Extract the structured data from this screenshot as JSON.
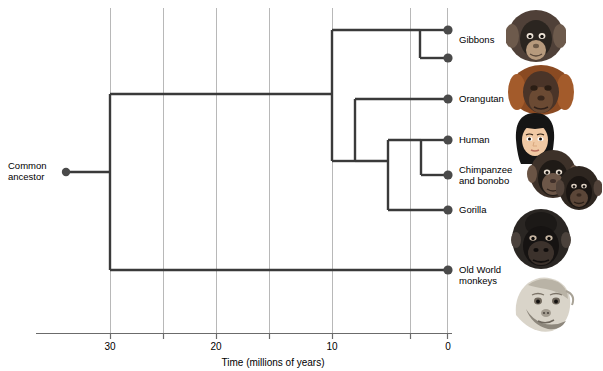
{
  "diagram": {
    "type": "phylogenetic-tree",
    "root_label": "Common\nancestor",
    "axis": {
      "title": "Time (millions of years)",
      "ticks": [
        30,
        25,
        20,
        15,
        10,
        5,
        0
      ],
      "tick_labels_shown": [
        "30",
        "20",
        "10",
        "0"
      ],
      "gridlines_at": [
        30,
        25,
        20,
        15,
        10,
        5,
        0
      ],
      "direction": "right-to-left",
      "units": "millions of years"
    },
    "taxa": [
      {
        "name": "Gibbons",
        "divergence_mya": 3,
        "tip_mya": 0
      },
      {
        "name": "Orangutan",
        "divergence_mya": 11,
        "tip_mya": 0
      },
      {
        "name": "Human",
        "divergence_mya": 6,
        "tip_mya": 0
      },
      {
        "name": "Chimpanzee\nand bonobo",
        "divergence_mya": 5,
        "tip_mya": 0
      },
      {
        "name": "Gorilla",
        "divergence_mya": 7,
        "tip_mya": 0
      },
      {
        "name": "Old World\nmonkeys",
        "divergence_mya": 30,
        "tip_mya": 0
      }
    ],
    "labels": {
      "common_ancestor": "Common\nancestor",
      "gibbons": "Gibbons",
      "orangutan": "Orangutan",
      "human": "Human",
      "chimpanzee": "Chimpanzee\nand bonobo",
      "gorilla": "Gorilla",
      "old_world_monkeys": "Old World\nmonkeys",
      "tick_30": "30",
      "tick_20": "20",
      "tick_10": "10",
      "tick_0": "0",
      "axis_title": "Time (millions of years)"
    },
    "colors": {
      "branch": "#3a3a3a",
      "node": "#4a4a4a",
      "gridline": "#b8b8b8",
      "axis": "#6b6b6b",
      "text": "#000000",
      "background": "#ffffff"
    }
  }
}
